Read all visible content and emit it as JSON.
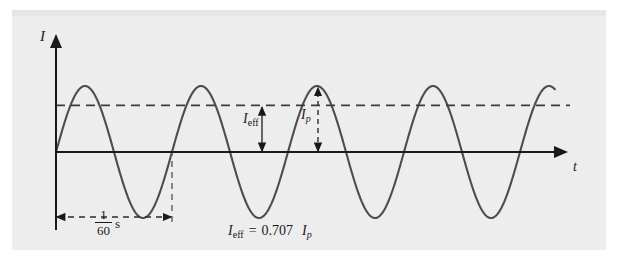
{
  "figure": {
    "background_color": "#eeeeee",
    "page_color": "#ffffff",
    "curve_color": "#4d4d4d",
    "axis_color": "#1a1a1a",
    "dash_color": "#555555"
  },
  "axes": {
    "y_label": "I",
    "x_label": "t",
    "y_axis_name": "current",
    "x_axis_name": "time"
  },
  "annotations": {
    "effective_label_main": "I",
    "effective_label_sub": "eff",
    "peak_label_main": "I",
    "peak_label_sub": "p",
    "period_numerator": "1",
    "period_denominator": "60",
    "period_unit": "s"
  },
  "equation": {
    "lhs_main": "I",
    "lhs_sub": "eff",
    "operator": "=",
    "coefficient": "0.707",
    "rhs_main": "I",
    "rhs_sub": "p",
    "full_text": "I_eff = 0.707 I_p"
  },
  "chart_data": {
    "type": "line",
    "title": "",
    "xlabel": "t",
    "ylabel": "I",
    "grid": false,
    "legend": null,
    "waveform": "sine",
    "amplitude": 1.0,
    "period_seconds": 0.0166667,
    "period_label": "1/60 s",
    "frequency_hz": 60,
    "effective_value_ratio": 0.707,
    "peak_value_ratio": 1.0,
    "x": [
      0,
      0.125,
      0.25,
      0.375,
      0.5,
      0.625,
      0.75,
      0.875,
      1.0,
      1.125,
      1.25,
      1.375,
      1.5,
      1.625,
      1.75,
      1.875,
      2.0,
      2.125,
      2.25,
      2.375,
      2.5,
      2.625,
      2.75,
      2.875,
      3.0,
      3.125,
      3.25,
      3.375,
      3.5,
      3.625,
      3.75,
      3.875,
      4.0,
      4.125,
      4.25,
      4.3
    ],
    "y": [
      0,
      0.707,
      1.0,
      0.707,
      0,
      -0.707,
      -1.0,
      -0.707,
      0,
      0.707,
      1.0,
      0.707,
      0,
      -0.707,
      -1.0,
      -0.707,
      0,
      0.707,
      1.0,
      0.707,
      0,
      -0.707,
      -1.0,
      -0.707,
      0,
      0.707,
      1.0,
      0.707,
      0,
      -0.707,
      -1.0,
      -0.707,
      0,
      0.707,
      1.0,
      1.0
    ],
    "x_unit": "periods",
    "cycles_shown": 4.3,
    "reference_lines": [
      {
        "name": "effective-current-level",
        "value": 0.707,
        "style": "dashed",
        "orientation": "horizontal"
      },
      {
        "name": "one-period-marker",
        "value": 1.0,
        "style": "dashed",
        "orientation": "vertical"
      }
    ],
    "measurements": [
      {
        "name": "I_eff",
        "from": 0.0,
        "to": 0.707,
        "label": "I_eff"
      },
      {
        "name": "I_p",
        "from": 0.0,
        "to": 1.0,
        "label": "I_p"
      }
    ]
  }
}
